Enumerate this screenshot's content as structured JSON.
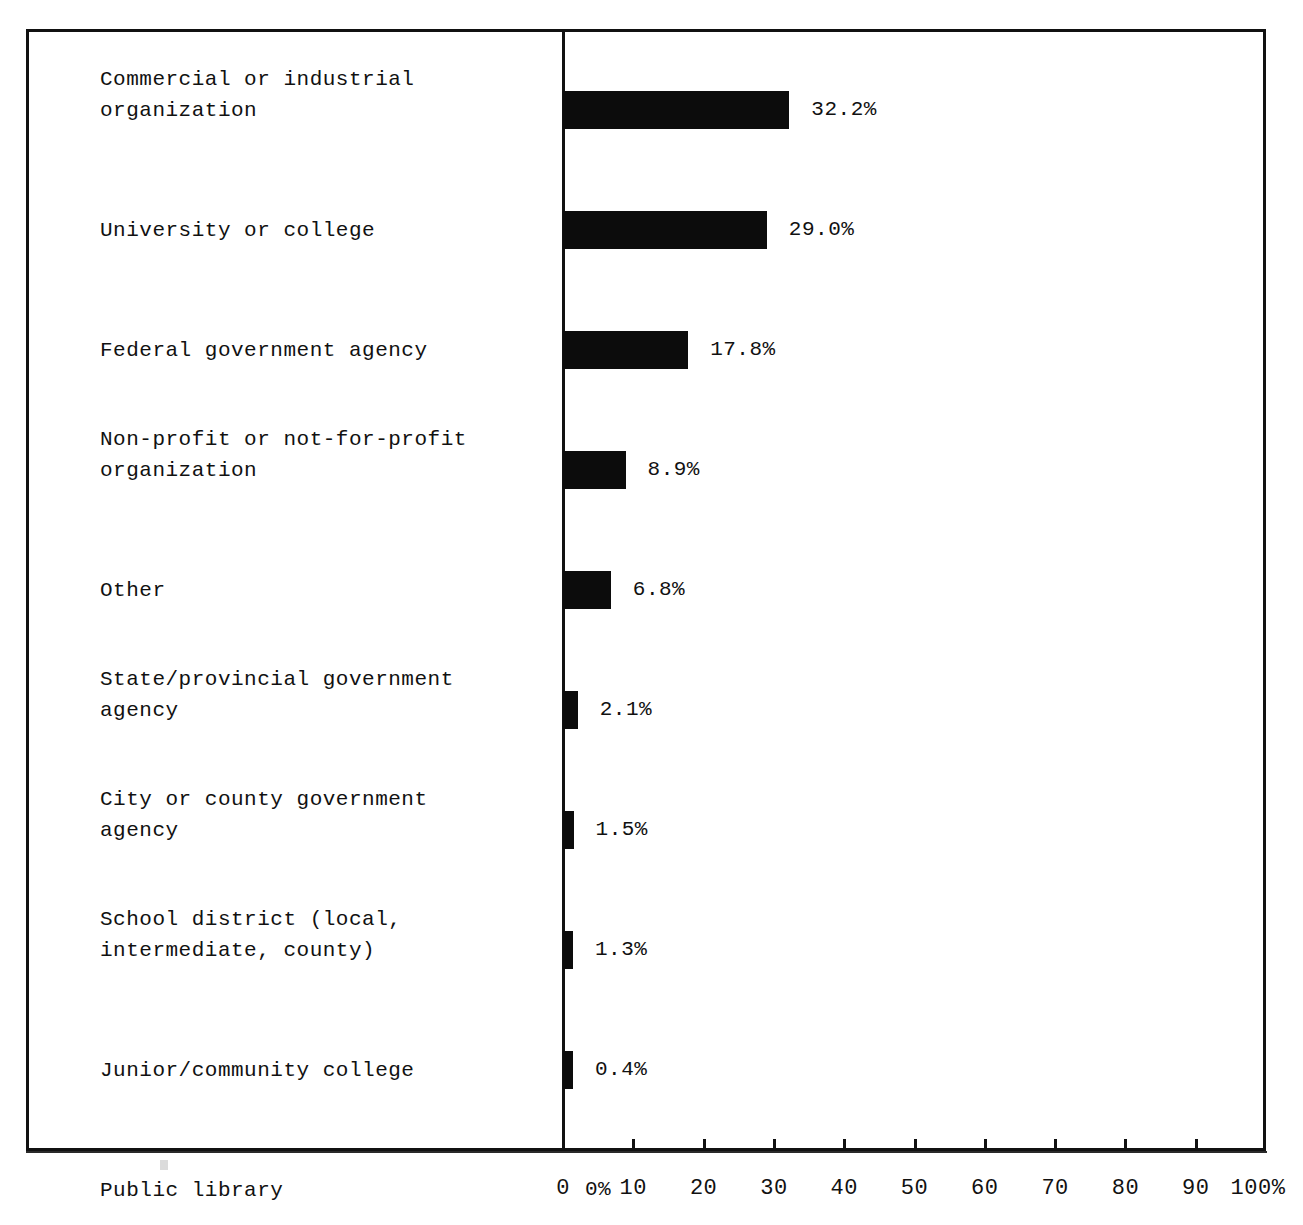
{
  "chart_data": {
    "type": "bar",
    "orientation": "horizontal",
    "title": "",
    "subtitle": "",
    "xlabel": "",
    "ylabel": "",
    "xlim": [
      0,
      100
    ],
    "grid": false,
    "legend": null,
    "axis_unit": "%",
    "categories": [
      "Commercial or industrial\norganization",
      "University or college",
      "Federal government agency",
      "Non-profit or not-for-profit\norganization",
      "Other",
      "State/provincial government\nagency",
      "City or county government\nagency",
      "School district (local,\nintermediate, county)",
      "Junior/community college",
      "Public library"
    ],
    "values": [
      32.2,
      29.0,
      17.8,
      8.9,
      6.8,
      2.1,
      1.5,
      1.3,
      0.4,
      0
    ],
    "value_labels": [
      "32.2%",
      "29.0%",
      "17.8%",
      "8.9%",
      "6.8%",
      "2.1%",
      "1.5%",
      "1.3%",
      "0.4%",
      "0%"
    ],
    "xticks": [
      0,
      10,
      20,
      30,
      40,
      50,
      60,
      70,
      80,
      90,
      100
    ],
    "xtick_labels": [
      "0",
      "10",
      "20",
      "30",
      "40",
      "50",
      "60",
      "70",
      "80",
      "90",
      "100%"
    ],
    "bar_color": "#0c0c0c",
    "frame_color": "#111111",
    "background_color": "#ffffff"
  }
}
